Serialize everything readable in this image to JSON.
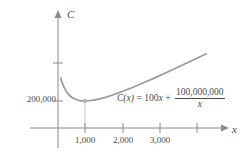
{
  "figure": {
    "axes": {
      "y_axis_label": "C",
      "x_axis_label": "x"
    },
    "equation": {
      "function_name": "C(x)",
      "equals": "=",
      "linear_coefficient": "100",
      "linear_variable": "x",
      "plus": "+",
      "fraction_numerator": "100,000,000",
      "fraction_denominator": "x",
      "full_text": "C(x) = 100x + 100,000,000/x"
    },
    "colors": {
      "curve": "#9a9a9a",
      "axis": "#7d7d7d",
      "text": "#4a4a4a",
      "dropline": "#d8d8d8",
      "background": "#ffffff"
    }
  },
  "chart_data": {
    "type": "line",
    "title": "",
    "xlabel": "x",
    "ylabel": "C",
    "grid": false,
    "legend": false,
    "function": "C(x) = 100x + 100000000/x",
    "xlim": [
      0,
      4500
    ],
    "ylim": [
      0,
      600000
    ],
    "xticks": [
      1000,
      2000,
      3000,
      4000
    ],
    "xtick_labels": [
      "1,000",
      "2,000",
      "3,000",
      ""
    ],
    "yticks": [
      200000,
      400000
    ],
    "ytick_labels": [
      "200,000",
      ""
    ],
    "annotations": [
      {
        "name": "minimum-point",
        "x": 1000,
        "y": 200000,
        "marker": "dot",
        "dropline": true
      }
    ],
    "series": [
      {
        "name": "C(x)",
        "x": [
          350,
          400,
          460,
          530,
          610,
          700,
          800,
          900,
          1000,
          1150,
          1300,
          1500,
          1700,
          2000,
          2300,
          2600,
          2900,
          3200,
          3500,
          3800,
          4100,
          4250
        ],
        "y": [
          320714,
          290000,
          263391,
          241679,
          225000,
          212857,
          205000,
          201111,
          200000,
          202456,
          206923,
          216667,
          228824,
          250000,
          273478,
          298462,
          324483,
          351250,
          378571,
          406316,
          434390,
          448324
        ]
      }
    ]
  }
}
